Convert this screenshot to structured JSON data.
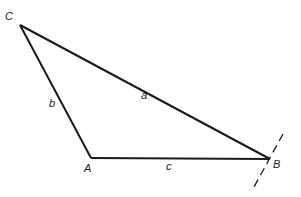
{
  "diagram": {
    "type": "triangle",
    "vertices": [
      {
        "name": "C",
        "x": 20,
        "y": 25
      },
      {
        "name": "A",
        "x": 91,
        "y": 158
      },
      {
        "name": "B",
        "x": 270,
        "y": 159
      }
    ],
    "sides": [
      {
        "name": "a",
        "from": "C",
        "to": "B"
      },
      {
        "name": "b",
        "from": "C",
        "to": "A"
      },
      {
        "name": "c",
        "from": "A",
        "to": "B"
      }
    ],
    "labels": {
      "vertex_C": "C",
      "vertex_A": "A",
      "vertex_B": "B",
      "side_a": "a",
      "side_b": "b",
      "side_c": "c"
    },
    "dashed_line_through": "B",
    "colors": {
      "stroke": "#1a1a1a",
      "background": "#ffffff"
    }
  }
}
